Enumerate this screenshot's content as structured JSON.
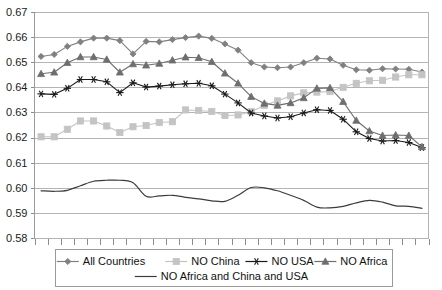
{
  "chart_data": {
    "type": "line",
    "title": "",
    "xlabel": "",
    "ylabel": "",
    "ylim": [
      0.58,
      0.67
    ],
    "ytick_labels": [
      "0.67",
      "0.66",
      "0.65",
      "0.64",
      "0.63",
      "0.62",
      "0.61",
      "0.60",
      "0.59",
      "0.58"
    ],
    "ytick_values": [
      0.67,
      0.66,
      0.65,
      0.64,
      0.63,
      0.62,
      0.61,
      0.6,
      0.59,
      0.58
    ],
    "grid": true,
    "xtick_count": 31,
    "xtick_labels": [],
    "legend_position": "bottom",
    "x": [
      1,
      2,
      3,
      4,
      5,
      6,
      7,
      8,
      9,
      10,
      11,
      12,
      13,
      14,
      15,
      16,
      17,
      18,
      19,
      20,
      21,
      22,
      23,
      24,
      25,
      26,
      27,
      28,
      29,
      30
    ],
    "series": [
      {
        "name": "All Countries",
        "color": "#808080",
        "marker": "diamond",
        "values": [
          0.6525,
          0.6533,
          0.6565,
          0.6583,
          0.6598,
          0.6598,
          0.6588,
          0.6535,
          0.6585,
          0.6583,
          0.6592,
          0.66,
          0.6606,
          0.6597,
          0.6575,
          0.655,
          0.65,
          0.6483,
          0.648,
          0.6483,
          0.65,
          0.6518,
          0.6515,
          0.649,
          0.6472,
          0.647,
          0.6476,
          0.6475,
          0.6474,
          0.6463
        ]
      },
      {
        "name": "NO China",
        "color": "#c4c4c4",
        "marker": "square",
        "values": [
          0.6205,
          0.6205,
          0.6235,
          0.6268,
          0.6268,
          0.6248,
          0.6222,
          0.6245,
          0.625,
          0.6262,
          0.6265,
          0.6312,
          0.631,
          0.6306,
          0.629,
          0.6292,
          0.6305,
          0.633,
          0.6348,
          0.6368,
          0.638,
          0.6383,
          0.6385,
          0.6402,
          0.6418,
          0.6428,
          0.643,
          0.6443,
          0.6452,
          0.6452
        ]
      },
      {
        "name": "NO USA",
        "color": "#1a1a1a",
        "marker": "star",
        "values": [
          0.6376,
          0.6374,
          0.6398,
          0.6433,
          0.6433,
          0.6424,
          0.6381,
          0.642,
          0.6403,
          0.6407,
          0.6412,
          0.6416,
          0.6418,
          0.6408,
          0.6375,
          0.634,
          0.63,
          0.6288,
          0.628,
          0.6285,
          0.63,
          0.6313,
          0.631,
          0.6275,
          0.6225,
          0.6198,
          0.6188,
          0.619,
          0.6182,
          0.6162
        ]
      },
      {
        "name": "NO Africa",
        "color": "#6e6e6e",
        "marker": "triangle",
        "values": [
          0.6456,
          0.6462,
          0.65,
          0.6523,
          0.6523,
          0.6513,
          0.6462,
          0.6495,
          0.649,
          0.6497,
          0.651,
          0.6522,
          0.652,
          0.6504,
          0.6458,
          0.6418,
          0.6365,
          0.6338,
          0.633,
          0.634,
          0.636,
          0.6398,
          0.64,
          0.6345,
          0.627,
          0.6228,
          0.621,
          0.6212,
          0.621,
          0.6165
        ]
      },
      {
        "name": "NO Africa and China and USA",
        "color": "#3c3c3c",
        "marker": "none",
        "values": [
          0.599,
          0.5988,
          0.5992,
          0.601,
          0.6028,
          0.6032,
          0.6032,
          0.6022,
          0.5968,
          0.597,
          0.5972,
          0.5964,
          0.5958,
          0.595,
          0.5948,
          0.5972,
          0.6003,
          0.6002,
          0.599,
          0.5972,
          0.5952,
          0.5925,
          0.5922,
          0.5928,
          0.5942,
          0.5952,
          0.5945,
          0.593,
          0.5928,
          0.592
        ]
      }
    ]
  },
  "legend": {
    "items": [
      {
        "label": "All Countries"
      },
      {
        "label": "NO China"
      },
      {
        "label": "NO USA"
      },
      {
        "label": "NO Africa"
      },
      {
        "label": "NO Africa and China and USA"
      }
    ]
  }
}
